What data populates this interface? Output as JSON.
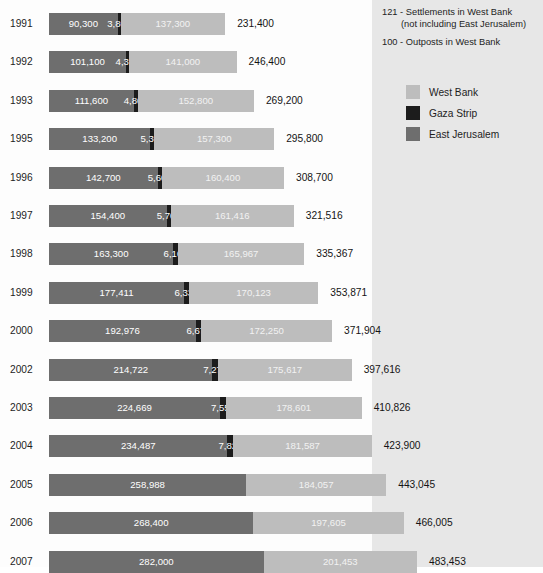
{
  "chart_data": {
    "type": "bar",
    "title": "",
    "subtitle": "",
    "xlabel": "",
    "ylabel": "",
    "orientation": "horizontal",
    "stacked": true,
    "grid": false,
    "legend_position": "right",
    "axis_max": 483453,
    "categories": [
      "1991",
      "1992",
      "1993",
      "1995",
      "1996",
      "1997",
      "1998",
      "1999",
      "2000",
      "2002",
      "2003",
      "2004",
      "2005",
      "2006",
      "2007"
    ],
    "series": [
      {
        "name": "East Jerusalem",
        "color": "#6e6e6e",
        "values": [
          90300,
          101100,
          111600,
          133200,
          142700,
          154400,
          163300,
          177411,
          192976,
          214722,
          224669,
          234487,
          258988,
          268400,
          282000
        ]
      },
      {
        "name": "Gaza Strip",
        "color": "#1c1c1c",
        "values": [
          3800,
          4300,
          4800,
          5300,
          5600,
          5700,
          6100,
          6337,
          6678,
          7277,
          7556,
          7826,
          null,
          null,
          null
        ]
      },
      {
        "name": "West Bank",
        "color": "#bdbdbd",
        "values": [
          137300,
          141000,
          152800,
          157300,
          160400,
          161416,
          165967,
          170123,
          172250,
          175617,
          178601,
          181587,
          184057,
          197605,
          201453
        ]
      }
    ],
    "totals": [
      231400,
      246400,
      269200,
      295800,
      308700,
      321516,
      335367,
      353871,
      371904,
      397616,
      410826,
      423900,
      443045,
      466005,
      483453
    ],
    "rows": [
      {
        "year": "1991",
        "east_jerusalem": "90,300",
        "gaza": "3,800",
        "west_bank": "137,300",
        "total": "231,400",
        "ej_val": 90300,
        "gz_val": 3800,
        "wb_val": 137300,
        "total_val": 231400
      },
      {
        "year": "1992",
        "east_jerusalem": "101,100",
        "gaza": "4,300",
        "west_bank": "141,000",
        "total": "246,400",
        "ej_val": 101100,
        "gz_val": 4300,
        "wb_val": 141000,
        "total_val": 246400
      },
      {
        "year": "1993",
        "east_jerusalem": "111,600",
        "gaza": "4,800",
        "west_bank": "152,800",
        "total": "269,200",
        "ej_val": 111600,
        "gz_val": 4800,
        "wb_val": 152800,
        "total_val": 269200
      },
      {
        "year": "1995",
        "east_jerusalem": "133,200",
        "gaza": "5,300",
        "west_bank": "157,300",
        "total": "295,800",
        "ej_val": 133200,
        "gz_val": 5300,
        "wb_val": 157300,
        "total_val": 295800
      },
      {
        "year": "1996",
        "east_jerusalem": "142,700",
        "gaza": "5,600",
        "west_bank": "160,400",
        "total": "308,700",
        "ej_val": 142700,
        "gz_val": 5600,
        "wb_val": 160400,
        "total_val": 308700
      },
      {
        "year": "1997",
        "east_jerusalem": "154,400",
        "gaza": "5,700",
        "west_bank": "161,416",
        "total": "321,516",
        "ej_val": 154400,
        "gz_val": 5700,
        "wb_val": 161416,
        "total_val": 321516
      },
      {
        "year": "1998",
        "east_jerusalem": "163,300",
        "gaza": "6,100",
        "west_bank": "165,967",
        "total": "335,367",
        "ej_val": 163300,
        "gz_val": 6100,
        "wb_val": 165967,
        "total_val": 335367
      },
      {
        "year": "1999",
        "east_jerusalem": "177,411",
        "gaza": "6,337",
        "west_bank": "170,123",
        "total": "353,871",
        "ej_val": 177411,
        "gz_val": 6337,
        "wb_val": 170123,
        "total_val": 353871
      },
      {
        "year": "2000",
        "east_jerusalem": "192,976",
        "gaza": "6,678",
        "west_bank": "172,250",
        "total": "371,904",
        "ej_val": 192976,
        "gz_val": 6678,
        "wb_val": 172250,
        "total_val": 371904
      },
      {
        "year": "2002",
        "east_jerusalem": "214,722",
        "gaza": "7,277",
        "west_bank": "175,617",
        "total": "397,616",
        "ej_val": 214722,
        "gz_val": 7277,
        "wb_val": 175617,
        "total_val": 397616
      },
      {
        "year": "2003",
        "east_jerusalem": "224,669",
        "gaza": "7,556",
        "west_bank": "178,601",
        "total": "410,826",
        "ej_val": 224669,
        "gz_val": 7556,
        "wb_val": 178601,
        "total_val": 410826
      },
      {
        "year": "2004",
        "east_jerusalem": "234,487",
        "gaza": "7,826",
        "west_bank": "181,587",
        "total": "423,900",
        "ej_val": 234487,
        "gz_val": 7826,
        "wb_val": 181587,
        "total_val": 423900
      },
      {
        "year": "2005",
        "east_jerusalem": "258,988",
        "gaza": "",
        "west_bank": "184,057",
        "total": "443,045",
        "ej_val": 258988,
        "gz_val": 0,
        "wb_val": 184057,
        "total_val": 443045
      },
      {
        "year": "2006",
        "east_jerusalem": "268,400",
        "gaza": "",
        "west_bank": "197,605",
        "total": "466,005",
        "ej_val": 268400,
        "gz_val": 0,
        "wb_val": 197605,
        "total_val": 466005
      },
      {
        "year": "2007",
        "east_jerusalem": "282,000",
        "gaza": "",
        "west_bank": "201,453",
        "total": "483,453",
        "ej_val": 282000,
        "gz_val": 0,
        "wb_val": 201453,
        "total_val": 483453
      }
    ]
  },
  "notes": {
    "line1": "121 - Settlements in West Bank",
    "line2": "(not including East Jerusalem)",
    "line3": "100 - Outposts in West Bank"
  },
  "legend": {
    "items": [
      {
        "label": "West Bank",
        "color": "#bdbdbd",
        "icon": "legend-swatch-west-bank"
      },
      {
        "label": "Gaza Strip",
        "color": "#1c1c1c",
        "icon": "legend-swatch-gaza-strip"
      },
      {
        "label": "East Jerusalem",
        "color": "#6e6e6e",
        "icon": "legend-swatch-east-jerusalem"
      }
    ]
  },
  "colors": {
    "west_bank": "#bdbdbd",
    "gaza_strip": "#1c1c1c",
    "east_jerusalem": "#6e6e6e",
    "panel": "#e7e7e7",
    "background": "#fdfdfd",
    "text": "#1d1d1d"
  }
}
